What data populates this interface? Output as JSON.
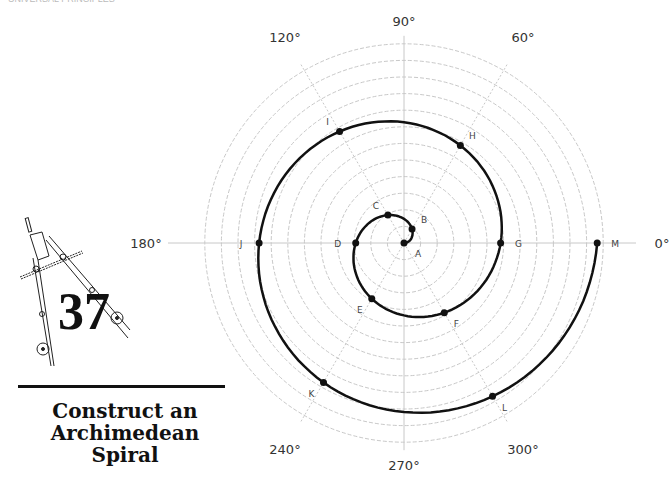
{
  "header_fragment": "UNIVERSAL PRINCIPLES",
  "activity_number": "37",
  "title_lines": [
    "Construct an",
    "Archimedean",
    "Spiral"
  ],
  "diagram": {
    "type": "polar-grid-spiral",
    "center": [
      404,
      243
    ],
    "grid_circle_count": 12,
    "grid_circle_spacing": 16.6,
    "spiral_step_per_60deg": 16.1,
    "spiral_turns_degrees": 720,
    "radial_axes": [
      {
        "angle": 0,
        "label": "0°",
        "style": "solid"
      },
      {
        "angle": 60,
        "label": "60°",
        "style": "dashed"
      },
      {
        "angle": 90,
        "label": "90°",
        "style": "solid"
      },
      {
        "angle": 120,
        "label": "120°",
        "style": "dashed"
      },
      {
        "angle": 180,
        "label": "180°",
        "style": "solid"
      },
      {
        "angle": 240,
        "label": "240°",
        "style": "dashed"
      },
      {
        "angle": 270,
        "label": "270°",
        "style": "solid"
      },
      {
        "angle": 300,
        "label": "300°",
        "style": "dashed"
      }
    ],
    "points": [
      {
        "label": "A",
        "angle": 0,
        "step": 0
      },
      {
        "label": "B",
        "angle": 60,
        "step": 1
      },
      {
        "label": "C",
        "angle": 120,
        "step": 2
      },
      {
        "label": "D",
        "angle": 180,
        "step": 3
      },
      {
        "label": "E",
        "angle": 240,
        "step": 4
      },
      {
        "label": "F",
        "angle": 300,
        "step": 5
      },
      {
        "label": "G",
        "angle": 360,
        "step": 6
      },
      {
        "label": "H",
        "angle": 420,
        "step": 7
      },
      {
        "label": "I",
        "angle": 480,
        "step": 8
      },
      {
        "label": "J",
        "angle": 540,
        "step": 9
      },
      {
        "label": "K",
        "angle": 600,
        "step": 10
      },
      {
        "label": "L",
        "angle": 660,
        "step": 11
      },
      {
        "label": "M",
        "angle": 720,
        "step": 12
      }
    ],
    "colors": {
      "grid": "#c8c8c8",
      "spiral": "#111111",
      "label": "#444444"
    }
  }
}
